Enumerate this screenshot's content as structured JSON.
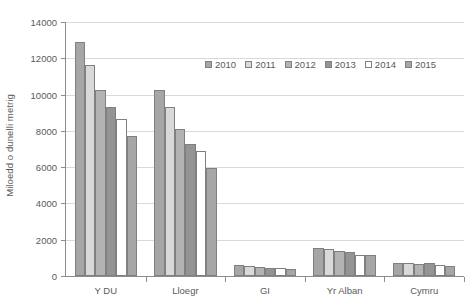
{
  "chart_data": {
    "type": "bar",
    "title": "",
    "xlabel": "",
    "ylabel": "Miloedd o dunelli metrig",
    "ylim": [
      0,
      14000
    ],
    "y_ticks": [
      "0",
      "2000",
      "4000",
      "6000",
      "8000",
      "10000",
      "12000",
      "14000"
    ],
    "y_tick_values": [
      0,
      2000,
      4000,
      6000,
      8000,
      10000,
      12000,
      14000
    ],
    "grid": true,
    "legend_position": "top-right-inside",
    "categories": [
      "Y DU",
      "Lloegr",
      "GI",
      "Yr Alban",
      "Cymru"
    ],
    "series": [
      {
        "name": "2010",
        "color": "#a6a6a6",
        "values": [
          12900,
          10280,
          620,
          1520,
          700
        ]
      },
      {
        "name": "2011",
        "color": "#d9d9d9",
        "values": [
          11650,
          9320,
          560,
          1470,
          690
        ]
      },
      {
        "name": "2012",
        "color": "#b3b3b3",
        "values": [
          10270,
          8130,
          480,
          1390,
          680
        ]
      },
      {
        "name": "2013",
        "color": "#949494",
        "values": [
          9320,
          7300,
          420,
          1350,
          690
        ]
      },
      {
        "name": "2014",
        "color": "#ffffff",
        "values": [
          8650,
          6900,
          440,
          1180,
          600
        ]
      },
      {
        "name": "2015",
        "color": "#a6a6a6",
        "values": [
          7700,
          5980,
          360,
          1170,
          550
        ]
      }
    ]
  },
  "legend": {
    "items": [
      {
        "label": "2010"
      },
      {
        "label": "2011"
      },
      {
        "label": "2012"
      },
      {
        "label": "2013"
      },
      {
        "label": "2014"
      },
      {
        "label": "2015"
      }
    ]
  }
}
